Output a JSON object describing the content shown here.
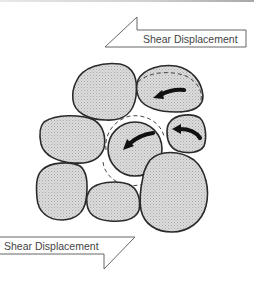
{
  "figure": {
    "top_arrow": {
      "label": "Shear Displacement",
      "direction": "left"
    },
    "bottom_arrow": {
      "label": "Shear Displacement",
      "direction": "right"
    },
    "pebbles": [
      {
        "id": "top-left"
      },
      {
        "id": "top-right",
        "rotating": true,
        "displaced": true
      },
      {
        "id": "middle-left"
      },
      {
        "id": "center",
        "rotating": true,
        "displaced": true
      },
      {
        "id": "middle-right-small",
        "rotating": true
      },
      {
        "id": "bottom-left"
      },
      {
        "id": "bottom-middle"
      },
      {
        "id": "bottom-right"
      }
    ],
    "colors": {
      "pebble_fill": "#d4d4d4",
      "outline": "#2a2a2a",
      "rotation_arrow": "#111111",
      "label_text": "#444444"
    }
  }
}
